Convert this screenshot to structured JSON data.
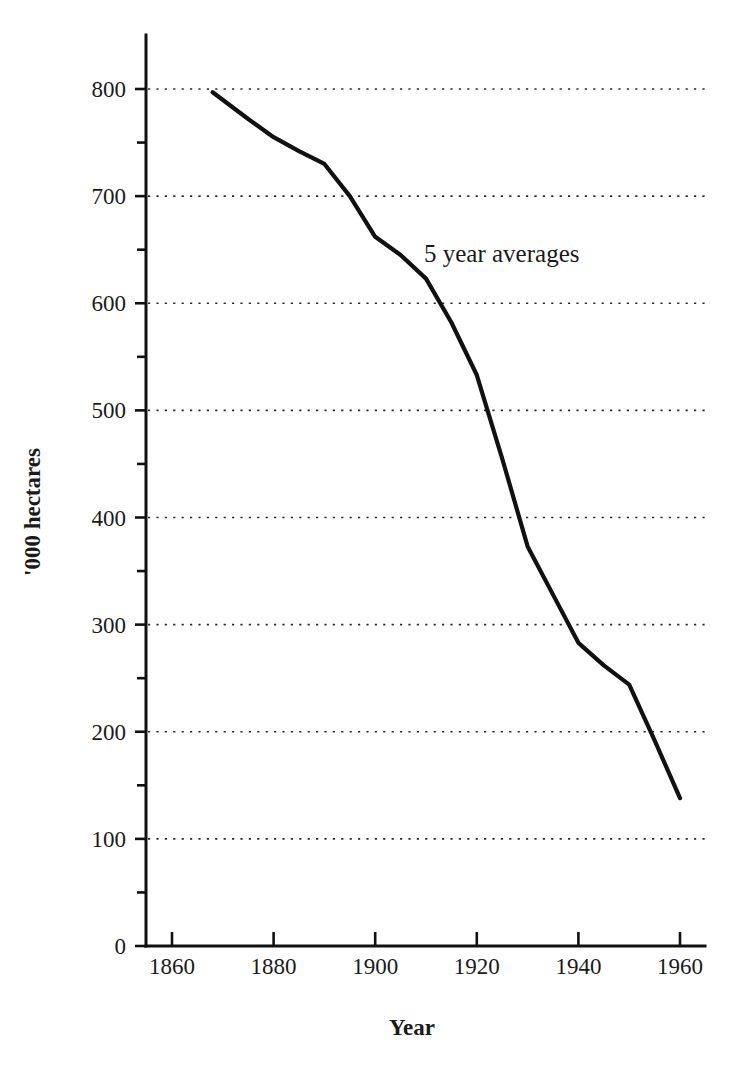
{
  "chart_data": {
    "type": "line",
    "title": "",
    "xlabel": "Year",
    "ylabel": "'000 hectares",
    "annotation": "5 year averages",
    "xlim": [
      1855,
      1965
    ],
    "ylim": [
      0,
      840
    ],
    "grid": "horizontal-dotted",
    "legend": "none",
    "x_ticks": [
      1860,
      1880,
      1900,
      1920,
      1940,
      1960
    ],
    "x_tick_labels": [
      "1860",
      "1880",
      "1900",
      "1920",
      "1940",
      "1960"
    ],
    "x_minor_ticks": [
      1870,
      1890,
      1910,
      1930,
      1950
    ],
    "y_ticks": [
      0,
      100,
      200,
      300,
      400,
      500,
      600,
      700,
      800
    ],
    "y_tick_labels": [
      "0",
      "100",
      "200",
      "300",
      "400",
      "500",
      "600",
      "700",
      "800"
    ],
    "y_minor_ticks": [
      50,
      150,
      250,
      350,
      450,
      550,
      650,
      750
    ],
    "gridline_values": [
      100,
      200,
      300,
      400,
      500,
      600,
      700,
      800
    ],
    "series": [
      {
        "name": "5 year averages",
        "x": [
          1868,
          1875,
          1880,
          1885,
          1890,
          1895,
          1900,
          1905,
          1910,
          1915,
          1920,
          1925,
          1930,
          1935,
          1940,
          1945,
          1950,
          1955,
          1960
        ],
        "values": [
          797,
          772,
          755,
          742,
          730,
          700,
          662,
          645,
          623,
          582,
          533,
          455,
          373,
          328,
          283,
          262,
          244,
          192,
          138
        ]
      }
    ]
  },
  "axes": {
    "y_title": "'000 hectares",
    "x_title": "Year"
  },
  "annotations": {
    "series_note": "5 year averages"
  },
  "colors": {
    "line": "#111111",
    "grid": "#2b2b2b",
    "axis": "#111111",
    "text": "#1a1a1a",
    "background": "#ffffff"
  }
}
